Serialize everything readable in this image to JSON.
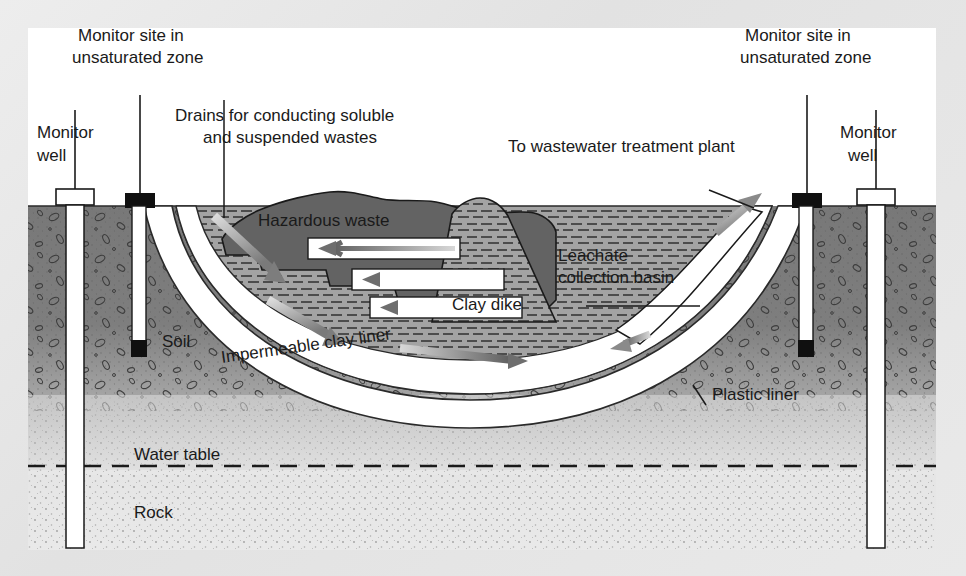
{
  "figure": {
    "background_color": "#e6e6e6",
    "panel_color": "#ffffff"
  },
  "labels": {
    "monitor_site_left_line1": "Monitor site in",
    "monitor_site_left_line2": "unsaturated zone",
    "monitor_well_left_line1": "Monitor",
    "monitor_well_left_line2": "well",
    "drains_line1": "Drains for conducting soluble",
    "drains_line2": "and suspended wastes",
    "to_wastewater": "To wastewater treatment plant",
    "monitor_site_right_line1": "Monitor site in",
    "monitor_site_right_line2": "unsaturated zone",
    "monitor_well_right_line1": "Monitor",
    "monitor_well_right_line2": "well",
    "hazardous_waste": "Hazardous waste",
    "leachate_line1": "Leachate",
    "leachate_line2": "collection basin",
    "clay_dike": "Clay dike",
    "soil": "Soil",
    "impermeable_clay_liner": "Impermeable clay liner",
    "plastic_liner": "Plastic liner",
    "water_table": "Water table",
    "rock": "Rock"
  },
  "colors": {
    "soil_fill": "#7d7d7d",
    "soil_fill_light": "#b9b9b9",
    "rock_fill": "#e2e2e2",
    "waste_fill": "#636363",
    "clay_fill": "#9c9c9c",
    "liner_white": "#ffffff",
    "outline": "#1a1a1a",
    "arrow_gray": "#8f8f8f",
    "cap_black": "#101010",
    "cap_white": "#ffffff"
  },
  "elements": {
    "wells": [
      {
        "name": "monitor-well-left",
        "cap": "white",
        "x": 75,
        "depth": 548
      },
      {
        "name": "monitor-site-left",
        "cap": "black",
        "x": 140,
        "depth": 352
      },
      {
        "name": "monitor-site-right",
        "cap": "black",
        "x": 807,
        "depth": 352
      },
      {
        "name": "monitor-well-right",
        "cap": "white",
        "x": 876,
        "depth": 548
      }
    ],
    "drain_pipes": [
      {
        "name": "drain-pipe-upper",
        "direction": "left"
      },
      {
        "name": "drain-pipe-middle",
        "direction": "left"
      },
      {
        "name": "drain-pipe-lower",
        "direction": "left"
      }
    ],
    "flow_arrows": [
      {
        "name": "flow-arrow-upper-slope",
        "direction": "down-right"
      },
      {
        "name": "flow-arrow-mid-slope",
        "direction": "down-right"
      },
      {
        "name": "flow-arrow-liner-base",
        "direction": "right"
      },
      {
        "name": "flow-arrow-outflow",
        "direction": "up-right"
      }
    ],
    "water_table_line_style": "dashed"
  }
}
